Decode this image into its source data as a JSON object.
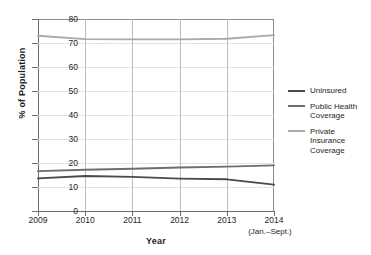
{
  "chart_data": {
    "type": "line",
    "title": "",
    "xlabel": "Year",
    "ylabel": "% of Population",
    "x": [
      "2009",
      "2010",
      "2011",
      "2012",
      "2013",
      "2014"
    ],
    "x_note": "(Jan.–Sept.)",
    "xlim": [
      2009,
      2014
    ],
    "ylim": [
      0,
      80
    ],
    "yticks": [
      0,
      10,
      20,
      30,
      40,
      50,
      60,
      70,
      80
    ],
    "grid": "both",
    "legend_position": "right",
    "series": [
      {
        "name": "Uninsured",
        "color": "#4a4a4a",
        "values": [
          13.6,
          14.6,
          14.2,
          13.5,
          13.2,
          11.0
        ]
      },
      {
        "name": "Public Health Coverage",
        "color": "#6e6e6e",
        "values": [
          16.6,
          17.2,
          17.6,
          18.1,
          18.5,
          19.0
        ]
      },
      {
        "name": "Private Insurance Coverage",
        "color": "#aaaaaa",
        "values": [
          73.0,
          71.6,
          71.5,
          71.5,
          71.8,
          73.3
        ]
      }
    ]
  },
  "axes": {
    "y_title": "% of Population",
    "x_title": "Year",
    "y_ticks": [
      "0",
      "10",
      "20",
      "30",
      "40",
      "50",
      "60",
      "70",
      "80"
    ],
    "x_ticks": [
      "2009",
      "2010",
      "2011",
      "2012",
      "2013",
      "2014"
    ],
    "x_tick_note": "(Jan.–Sept.)"
  },
  "legend": {
    "items": [
      {
        "label": "Uninsured",
        "color": "#4a4a4a"
      },
      {
        "label": "Public Health\nCoverage",
        "color": "#6e6e6e"
      },
      {
        "label": "Private Insurance\nCoverage",
        "color": "#aaaaaa"
      }
    ]
  },
  "colors": {
    "background": "#ffffff",
    "axis": "#6e6e6e",
    "frame": "#8c8c8c",
    "gridline_horizontal": "#e3e3e3",
    "gridline_vertical": "#bdbdbd",
    "text": "#231f20"
  }
}
